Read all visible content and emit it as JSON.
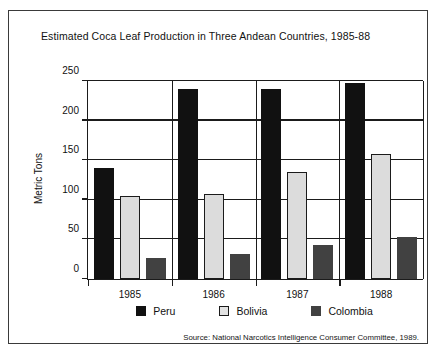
{
  "figure": {
    "title": "Estimated Coca Leaf Production in Three Andean Countries, 1985-88",
    "source": "Source:  National Narcotics Intelligence Consumer Committee, 1989."
  },
  "legend": {
    "items": [
      {
        "label": "Peru",
        "color": "#111111"
      },
      {
        "label": "Bolivia",
        "color": "#dcdcdc"
      },
      {
        "label": "Colombia",
        "color": "#414141"
      }
    ]
  },
  "chart_data": {
    "type": "bar",
    "title": "Estimated Coca Leaf Production in Three Andean Countries, 1985-88",
    "xlabel": "",
    "ylabel": "Metric Tons",
    "categories": [
      "1985",
      "1986",
      "1987",
      "1988"
    ],
    "series": [
      {
        "name": "Peru",
        "color": "#111111",
        "values": [
          140,
          240,
          240,
          248
        ]
      },
      {
        "name": "Bolivia",
        "color": "#dcdcdc",
        "values": [
          105,
          107,
          135,
          158
        ]
      },
      {
        "name": "Colombia",
        "color": "#414141",
        "values": [
          27,
          31,
          43,
          53
        ]
      }
    ],
    "ylim": [
      0,
      250
    ],
    "yticks": [
      0,
      50,
      100,
      150,
      200,
      250
    ],
    "ytick_labels": [
      "0",
      "50",
      "100",
      "150",
      "200",
      "250"
    ],
    "grid": true,
    "legend_position": "bottom",
    "units": "Metric Tons"
  }
}
